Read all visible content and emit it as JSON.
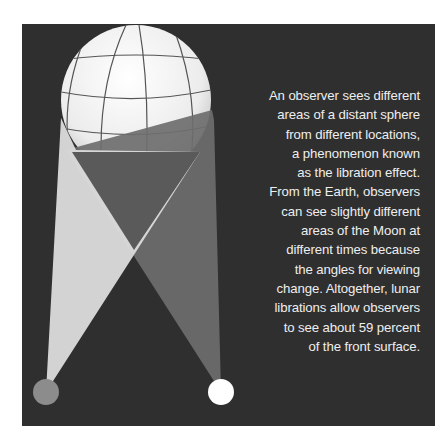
{
  "figure": {
    "caption_lines": [
      "An observer sees different",
      "areas of a distant sphere",
      "from different locations,",
      "a phenomenon known",
      "as the libration effect.",
      "From the Earth, observers",
      "can see slightly different",
      "areas of the Moon at",
      "different times because",
      "the angles for viewing",
      "change. Altogether, lunar",
      "librations allow observers",
      "to see about 59 percent",
      "of the front surface."
    ],
    "colors": {
      "background": "#2f2f2f",
      "sphere": "#f2f2f2",
      "grid_lines": "#555555",
      "left_beam": "#dcdcdc",
      "right_beam": "#6e6e6e",
      "left_observer": "#8c8c8c",
      "right_observer": "#ffffff"
    },
    "elements": [
      "sphere",
      "left-observer",
      "right-observer",
      "left-view-cone",
      "right-view-cone"
    ]
  }
}
